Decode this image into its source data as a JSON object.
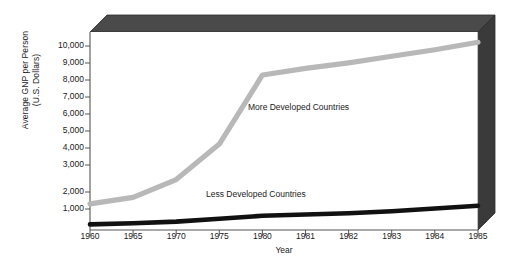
{
  "chart_data": {
    "type": "line",
    "title": "",
    "xlabel": "Year",
    "ylabel": "Average GNP per Person\n(U.S. Dollars)",
    "x": [
      1960,
      1965,
      1970,
      1975,
      1980,
      1981,
      1982,
      1983,
      1984,
      1985
    ],
    "xtick_labels": [
      "1960",
      "1965",
      "1970",
      "1975",
      "1980",
      "1981",
      "1982",
      "1983",
      "1984",
      "1985"
    ],
    "ytick_labels": [
      "10,000",
      "9,000",
      "8,000",
      "7,000",
      "6,000",
      "5,000",
      "4,000",
      "3,000",
      "2,000",
      "1,000"
    ],
    "ytick_values": [
      10000,
      9000,
      8000,
      7000,
      6000,
      5000,
      4000,
      3000,
      2000,
      1000
    ],
    "ylim": [
      0,
      10600
    ],
    "xlim": [
      1960,
      1985
    ],
    "grid": false,
    "legend_position": "inline-annotation",
    "series": [
      {
        "name": "More Developed Countries",
        "color": "#b8b8b8",
        "values": [
          1400,
          1750,
          2700,
          4600,
          8300,
          8650,
          8950,
          9300,
          9650,
          10050
        ]
      },
      {
        "name": "Less Developed Countries",
        "color": "#111111",
        "values": [
          300,
          360,
          450,
          600,
          760,
          830,
          900,
          1000,
          1150,
          1300
        ]
      }
    ],
    "frame": {
      "top_panel_color": "#4a4a4a",
      "right_panel_color": "#3f3f3f",
      "axis_color": "#555555",
      "plot_background": "#ffffff"
    }
  }
}
